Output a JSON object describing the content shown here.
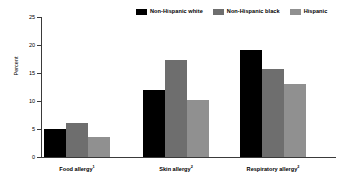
{
  "chart_data": {
    "type": "bar",
    "title": "",
    "subtitle": "",
    "xlabel": "",
    "ylabel": "Percent",
    "ylim": [
      0,
      25
    ],
    "yticks": [
      0,
      5,
      10,
      15,
      20,
      25
    ],
    "ytick_labels": [
      "0",
      "5",
      "10",
      "15",
      "20",
      "25"
    ],
    "grid": false,
    "legend_position": "top-right",
    "categories": [
      "Food allergy",
      "Skin allergy",
      "Respiratory allergy"
    ],
    "category_footnotes": [
      "1",
      "2",
      "2"
    ],
    "series": [
      {
        "name": "Non-Hispanic white",
        "color": "#000000",
        "values": [
          5.0,
          12.0,
          19.1
        ]
      },
      {
        "name": "Non-Hispanic black",
        "color": "#6e6e6e",
        "values": [
          6.0,
          17.4,
          15.7
        ]
      },
      {
        "name": "Hispanic",
        "color": "#909090",
        "values": [
          3.5,
          10.1,
          13.0
        ]
      }
    ]
  },
  "legend": {
    "items": [
      {
        "label": "Non-Hispanic white",
        "color": "#000000"
      },
      {
        "label": "Non-Hispanic black",
        "color": "#6e6e6e"
      },
      {
        "label": "Hispanic",
        "color": "#909090"
      }
    ]
  },
  "axes": {
    "y_label": "Percent",
    "y_ticks": [
      "25",
      "20",
      "15",
      "10",
      "5",
      "0"
    ],
    "x_labels": [
      {
        "text": "Food allergy",
        "footnote": "1"
      },
      {
        "text": "Skin allergy",
        "footnote": "2"
      },
      {
        "text": "Respiratory allergy",
        "footnote": "2"
      }
    ]
  }
}
